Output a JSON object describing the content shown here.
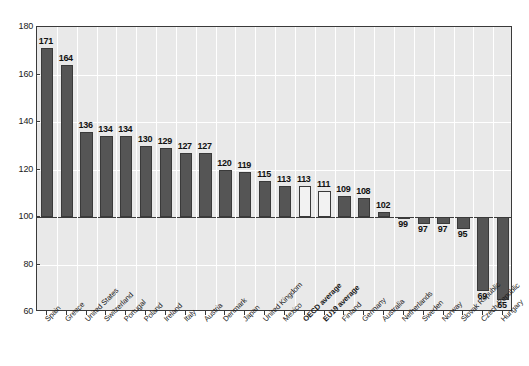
{
  "chart_data": {
    "type": "bar",
    "title": "",
    "subtitle": "",
    "xlabel": "",
    "ylabel": "",
    "ylim": [
      60,
      180
    ],
    "ytick_labels": [
      "60",
      "80",
      "100",
      "120",
      "140",
      "160",
      "180"
    ],
    "yticks": [
      60,
      80,
      100,
      120,
      140,
      160,
      180
    ],
    "grid": true,
    "legend": "none",
    "baseline": 100,
    "categories": [
      "Spain",
      "Greece",
      "United States",
      "Switzerland",
      "Portugal",
      "Poland",
      "Ireland",
      "Italy",
      "Austria",
      "Denmark",
      "Japan",
      "United Kingdom",
      "Mexico",
      "OECD average",
      "EU19 average",
      "Finland",
      "Germany",
      "Australia",
      "Netherlands",
      "Sweden",
      "Norway",
      "Slovak Republic",
      "Czech Republic",
      "Hungary"
    ],
    "values": [
      171,
      164,
      136,
      134,
      134,
      130,
      129,
      127,
      127,
      120,
      119,
      115,
      113,
      113,
      111,
      109,
      108,
      102,
      99,
      97,
      97,
      95,
      69,
      65
    ],
    "value_labels": [
      "171",
      "164",
      "136",
      "134",
      "134",
      "130",
      "129",
      "127",
      "127",
      "120",
      "119",
      "115",
      "113",
      "113",
      "111",
      "109",
      "108",
      "102",
      "99",
      "97",
      "97",
      "95",
      "69",
      "65"
    ],
    "highlighted": [
      false,
      false,
      false,
      false,
      false,
      false,
      false,
      false,
      false,
      false,
      false,
      false,
      false,
      true,
      true,
      false,
      false,
      false,
      false,
      false,
      false,
      false,
      false,
      false
    ],
    "bold_labels": [
      false,
      false,
      false,
      false,
      false,
      false,
      false,
      false,
      false,
      false,
      false,
      false,
      false,
      true,
      true,
      false,
      false,
      false,
      false,
      false,
      false,
      false,
      false,
      false
    ],
    "colors": {
      "bar_fill": "#555555",
      "bar_highlight_fill": "#f2f2f2",
      "bar_border": "#3a3a3a",
      "plot_background": "#e9e9e9",
      "gridline": "#ffffff",
      "axis": "#3a3a3a",
      "text": "#1a1a1a"
    }
  }
}
